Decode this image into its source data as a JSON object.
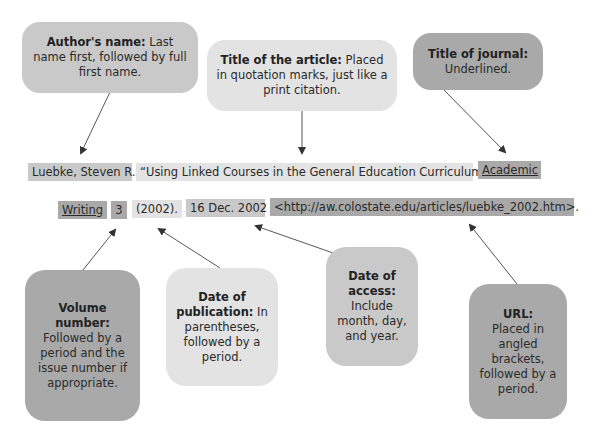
{
  "callouts": {
    "author": {
      "heading": "Author's name:",
      "body": " Last name first, followed by full first name."
    },
    "article_title": {
      "heading": "Title of the article:",
      "body": " Placed in quotation marks, just like a print citation."
    },
    "journal_title": {
      "heading": "Title of journal:",
      "body": "Underlined."
    },
    "volume": {
      "heading": "Volume number:",
      "body": "Followed by a period and the issue number if appropriate."
    },
    "publication_date": {
      "heading": "Date of publication:",
      "body": " In parentheses, followed by a period."
    },
    "access_date": {
      "heading": "Date of access:",
      "body": "Include month, day, and year."
    },
    "url": {
      "heading": "URL:",
      "body": "Placed in angled brackets, followed by a period."
    }
  },
  "citation": {
    "line1": {
      "author": "Luebke, Steven R.",
      "article_title": "“Using Linked Courses in the General Education Curriculum.”",
      "journal_part1": "Academic"
    },
    "line2": {
      "journal_part2": "Writing",
      "volume": "3",
      "publication_date": "(2002).",
      "access_date": "16 Dec. 2002",
      "url": "<http://aw.colostate.edu/articles/luebke_2002.htm>."
    }
  },
  "colors": {
    "light": "#e3e3e3",
    "medium": "#c9c9c9",
    "dark": "#a9a9a9",
    "text": "#2a2a2a",
    "arrow": "#333333"
  }
}
